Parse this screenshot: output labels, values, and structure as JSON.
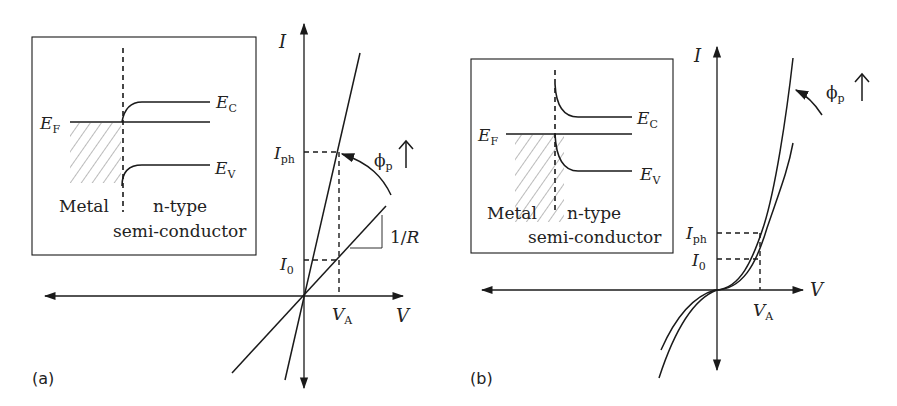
{
  "figure": {
    "colors": {
      "ink": "#1a1a1a",
      "background": "#ffffff",
      "hatch": "#555555"
    }
  },
  "panel_a": {
    "label": "(a)",
    "contact_type": "ohmic",
    "inset": {
      "ef_label": "E",
      "ef_sub": "F",
      "ec_label": "E",
      "ec_sub": "C",
      "ev_label": "E",
      "ev_sub": "V",
      "metal_label": "Metal",
      "semi_label_line1": "n-type",
      "semi_label_line2": "semi-conductor"
    },
    "axes": {
      "y_label": "I",
      "x_label": "V"
    },
    "annotations": {
      "iph_label": "I",
      "iph_sub": "ph",
      "i0_label": "I",
      "i0_sub": "0",
      "va_label": "V",
      "va_sub": "A",
      "flux_label": "ϕ",
      "flux_sub": "p",
      "flux_arrow": "↑",
      "slope_label_prefix": "1/",
      "slope_label_var": "R"
    },
    "curves": [
      {
        "name": "dark",
        "shape": "straight line through origin, slope 1/R"
      },
      {
        "name": "illuminated",
        "shape": "steeper straight line through origin"
      }
    ]
  },
  "panel_b": {
    "label": "(b)",
    "contact_type": "schottky",
    "inset": {
      "ef_label": "E",
      "ef_sub": "F",
      "ec_label": "E",
      "ec_sub": "C",
      "ev_label": "E",
      "ev_sub": "V",
      "metal_label": "Metal",
      "semi_label_line1": "n-type",
      "semi_label_line2": "semi-conductor"
    },
    "axes": {
      "y_label": "I",
      "x_label": "V"
    },
    "annotations": {
      "iph_label": "I",
      "iph_sub": "ph",
      "i0_label": "I",
      "i0_sub": "0",
      "va_label": "V",
      "va_sub": "A",
      "flux_label": "ϕ",
      "flux_sub": "p",
      "flux_arrow": "↑"
    },
    "curves": [
      {
        "name": "dark",
        "shape": "nonlinear symmetric-ish cubic through origin"
      },
      {
        "name": "illuminated",
        "shape": "steeper nonlinear curve through origin"
      }
    ]
  }
}
